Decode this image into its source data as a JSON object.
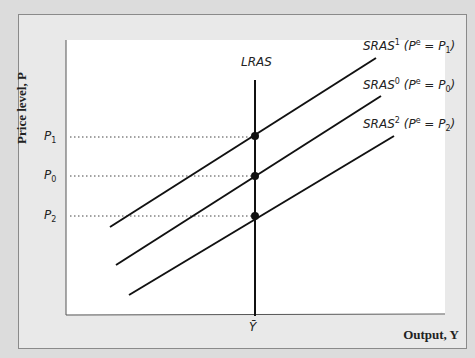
{
  "axes": {
    "y_label": "Price level, P",
    "x_label": "Output, Y"
  },
  "curves": {
    "lras": {
      "label": "LRAS"
    },
    "sras": [
      {
        "id": "sras1",
        "name": "SRAS",
        "sup": "1",
        "pe": "P",
        "pe_sub": "1",
        "eq_level": "P1"
      },
      {
        "id": "sras0",
        "name": "SRAS",
        "sup": "0",
        "pe": "P",
        "pe_sub": "0",
        "eq_level": "P0"
      },
      {
        "id": "sras2",
        "name": "SRAS",
        "sup": "2",
        "pe": "P",
        "pe_sub": "2",
        "eq_level": "P2"
      }
    ]
  },
  "price_levels": [
    {
      "name": "P",
      "sub": "1"
    },
    {
      "name": "P",
      "sub": "0"
    },
    {
      "name": "P",
      "sub": "2"
    }
  ],
  "x_tick": {
    "label": "Ȳ"
  },
  "label_text": {
    "p_open": "(P",
    "e_sup": "e",
    "equals": " = ",
    "close": ")"
  }
}
